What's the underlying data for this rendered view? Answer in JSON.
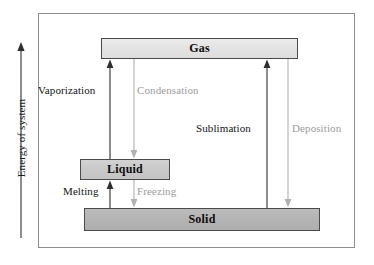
{
  "diagram": {
    "axis": {
      "label": "Energy of system",
      "direction_icon": "up-arrow-icon"
    },
    "phases": [
      {
        "id": "gas",
        "label": "Gas",
        "fill": "#e2e2e2"
      },
      {
        "id": "liquid",
        "label": "Liquid",
        "fill": "#c8c8c8"
      },
      {
        "id": "solid",
        "label": "Solid",
        "fill": "#b3b3b3"
      }
    ],
    "transitions": [
      {
        "id": "vaporization",
        "label": "Vaporization",
        "from": "liquid",
        "to": "gas",
        "direction": "up",
        "color": "#131313"
      },
      {
        "id": "condensation",
        "label": "Condensation",
        "from": "gas",
        "to": "liquid",
        "direction": "down",
        "color": "#9c9c9c"
      },
      {
        "id": "sublimation",
        "label": "Sublimation",
        "from": "solid",
        "to": "gas",
        "direction": "up",
        "color": "#131313"
      },
      {
        "id": "deposition",
        "label": "Deposition",
        "from": "gas",
        "to": "solid",
        "direction": "down",
        "color": "#9c9c9c"
      },
      {
        "id": "melting",
        "label": "Melting",
        "from": "solid",
        "to": "liquid",
        "direction": "up",
        "color": "#131313"
      },
      {
        "id": "freezing",
        "label": "Freezing",
        "from": "liquid",
        "to": "solid",
        "direction": "down",
        "color": "#9c9c9c"
      }
    ],
    "colors": {
      "frame_border": "#8e8e8e",
      "box_border": "#4a4a4a",
      "arrow_dark": "#2e2e2e",
      "arrow_light": "#b0b0b0",
      "background": "#ffffff"
    }
  }
}
